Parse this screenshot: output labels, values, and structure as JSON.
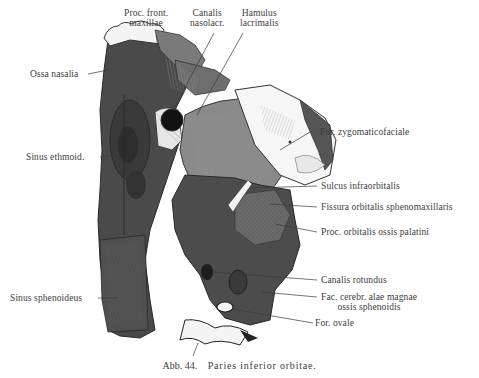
{
  "figure": {
    "caption_number": "Abb. 44.",
    "caption_title": "Paries inferior orbitae.",
    "colors": {
      "background": "#ffffff",
      "bone_dark": "#3f3f3f",
      "bone_mid": "#5a5a5a",
      "bone_light": "#808080",
      "bone_lighter": "#9a9a9a",
      "white_bone": "#f2f2f2",
      "label_text": "#3c3c3c",
      "leader_line": "#3a3a3a"
    }
  },
  "labels": {
    "proc_front_maxillae": {
      "line1": "Proc. front.",
      "line2": "maxillae"
    },
    "canalis_nasolacr": {
      "line1": "Canalis",
      "line2": "nasolacr."
    },
    "hamulus_lacrimalis": {
      "line1": "Hamulus",
      "line2": "lacrimalis"
    },
    "ossa_nasalia": "Ossa nasalia",
    "sinus_ethmoid": "Sinus ethmoid.",
    "sinus_sphenoideus": "Sinus sphenoideus",
    "for_zygomaticofaciale": "For. zygomaticofaciale",
    "sulcus_infraorbitalis": "Sulcus infraorbitalis",
    "fissura_orbitalis": "Fissura orbitalis sphenomaxillaris",
    "proc_orbitalis": "Proc. orbitalis ossis palatini",
    "canalis_rotundus": "Canalis rotundus",
    "fac_cerebr": {
      "line1": "Fac. cerebr. alae magnae",
      "line2": "ossis sphenoidis"
    },
    "for_ovale": "For. ovale"
  }
}
